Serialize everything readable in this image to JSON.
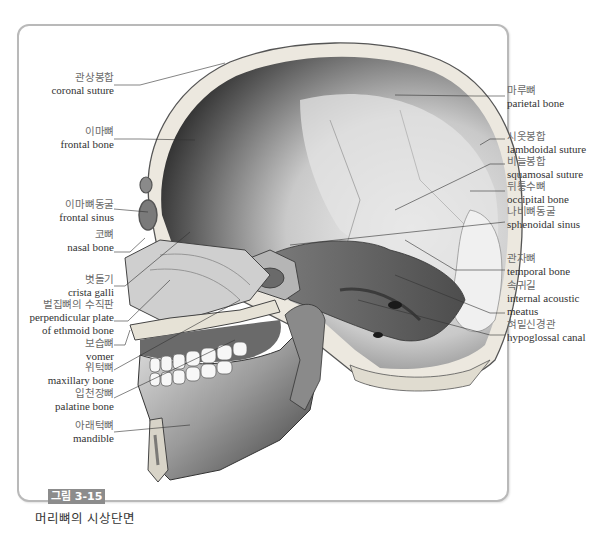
{
  "figure": {
    "number": "그림 3-15",
    "title": "머리뼈의 시상단면",
    "accent_color": "#8c8c8c"
  },
  "labels": {
    "left": [
      {
        "ko": "관상봉합",
        "en": "coronal suture"
      },
      {
        "ko": "이마뼈",
        "en": "frontal bone"
      },
      {
        "ko": "이마뼈동굴",
        "en": "frontal sinus"
      },
      {
        "ko": "코뼈",
        "en": "nasal bone"
      },
      {
        "ko": "볏돌기",
        "en": "crista galli"
      },
      {
        "ko": "벌집뼈의 수직판",
        "en": "perpendicular plate",
        "en2": "of ethmoid bone"
      },
      {
        "ko": "보습뼈",
        "en": "vomer"
      },
      {
        "ko": "위턱뼈",
        "en": "maxillary bone"
      },
      {
        "ko": "입천장뼈",
        "en": "palatine bone"
      },
      {
        "ko": "아래턱뼈",
        "en": "mandible"
      }
    ],
    "right": [
      {
        "ko": "마루뼈",
        "en": "parietal bone"
      },
      {
        "ko": "시옷봉합",
        "en": "lambdoidal suture"
      },
      {
        "ko": "비늘봉합",
        "en": "squamosal suture"
      },
      {
        "ko": "뒤통수뼈",
        "en": "occipital bone"
      },
      {
        "ko": "나비뼈동굴",
        "en": "sphenoidal sinus"
      },
      {
        "ko": "관자뼈",
        "en": "temporal bone"
      },
      {
        "ko": "속귀길",
        "en": "internal acoustic",
        "en2": "meatus"
      },
      {
        "ko": "혀밑신경관",
        "en": "hypoglossal canal"
      }
    ]
  }
}
